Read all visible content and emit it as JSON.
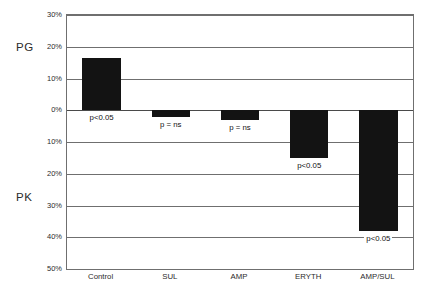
{
  "chart_data": {
    "type": "bar",
    "title": "",
    "subtitle": "",
    "xlabel": "",
    "ylabel": "",
    "categories": [
      "Control",
      "SUL",
      "AMP",
      "ERYTH",
      "AMP/SUL"
    ],
    "values": [
      16.5,
      -2,
      -3,
      -15,
      -38
    ],
    "series": [
      {
        "name": "percent change",
        "values": [
          16.5,
          -2,
          -3,
          -15,
          -38
        ]
      }
    ],
    "annotations": [
      "p<0.05",
      "p = ns",
      "p = ns",
      "p<0.05",
      "p<0.05"
    ],
    "ylim": [
      -50,
      30
    ],
    "ytick_values": [
      30,
      20,
      10,
      0,
      -10,
      -20,
      -30,
      -40,
      -50
    ],
    "ytick_labels": [
      "30%",
      "20%",
      "10%",
      "0%",
      "10%",
      "20%",
      "30%",
      "40%",
      "50%"
    ],
    "grid": true,
    "legend": false,
    "legend_position": "none",
    "region_labels": [
      {
        "text": "PG",
        "position": "upper-left"
      },
      {
        "text": "PK",
        "position": "lower-left"
      }
    ],
    "bar_color": "#131313",
    "axis_color": "#6f6f6f",
    "background": "#ffffff"
  },
  "side_labels": {
    "top": "PG",
    "bottom": "PK"
  }
}
